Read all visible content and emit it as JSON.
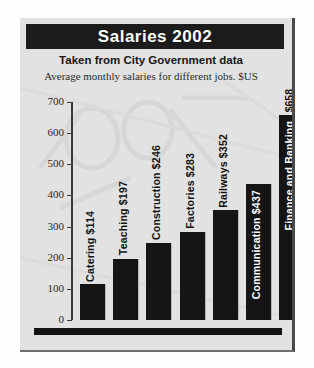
{
  "card": {
    "banner_title": "Salaries 2002",
    "subtitle": "Taken from City Government data",
    "caption": "Average monthly salaries for different jobs. $US"
  },
  "colors": {
    "banner_background": "#1c1c1c",
    "banner_text": "#ffffff",
    "bar_fill": "#151515",
    "card_background": "#e2e2e2",
    "axis": "#3a3a3a",
    "label_outside": "#121212",
    "label_inside": "#ffffff"
  },
  "chart_data": {
    "type": "bar",
    "title": "Salaries 2002",
    "subtitle": "Taken from City Government data",
    "annotation": "Average monthly salaries for different jobs. $US",
    "xlabel": "",
    "ylabel": "",
    "ylim": [
      0,
      700
    ],
    "ytick_values": [
      0,
      100,
      200,
      300,
      400,
      500,
      600,
      700
    ],
    "ytick_labels": [
      "0",
      "100",
      "200",
      "300",
      "400",
      "500",
      "600",
      "700"
    ],
    "grid": false,
    "legend": false,
    "categories": [
      "Catering",
      "Teaching",
      "Construction",
      "Factories",
      "Railways",
      "Communication",
      "Finance and Banking"
    ],
    "values": [
      114,
      197,
      246,
      283,
      352,
      437,
      658
    ],
    "bar_labels": [
      "Catering $114",
      "Teaching $197",
      "Construction $246",
      "Factories $283",
      "Railways $352",
      "Communication $437",
      "Finance and Banking"
    ],
    "label_placement": [
      "outside",
      "outside",
      "outside",
      "outside",
      "outside",
      "inside",
      "inside"
    ],
    "value_above_bar": [
      "",
      "",
      "",
      "",
      "",
      "",
      "$658"
    ],
    "currency": "$US"
  }
}
